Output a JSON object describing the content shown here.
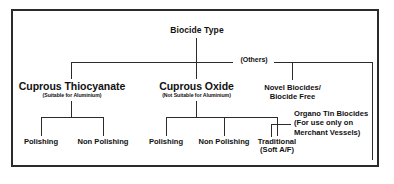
{
  "diagram": {
    "type": "tree",
    "title": "Biocide Type",
    "root": {
      "label": "Biocide Type"
    },
    "others_label": "(Others)",
    "branches": [
      {
        "id": "cuprous-thiocyanate",
        "label": "Cuprous Thiocyanate",
        "subtitle": "(Suitable for Aluminium)",
        "children": [
          {
            "id": "ct-polishing",
            "label": "Polishing"
          },
          {
            "id": "ct-non-polishing",
            "label": "Non Polishing"
          }
        ]
      },
      {
        "id": "cuprous-oxide",
        "label": "Cuprous Oxide",
        "subtitle": "(Not Suitable for Aluminium)",
        "children": [
          {
            "id": "co-polishing",
            "label": "Polishing"
          },
          {
            "id": "co-non-polishing",
            "label": "Non Polishing"
          },
          {
            "id": "co-traditional",
            "label": "Traditional",
            "sublabel": "(Soft A/F)"
          }
        ]
      },
      {
        "id": "novel-biocides",
        "label_line1": "Novel Biocides/",
        "label_line2": "Biocide Free"
      },
      {
        "id": "organo-tin-biocides",
        "label_line1": "Organo Tin Biocides",
        "label_line2": "(For use only on",
        "label_line3": "Merchant Vessels)"
      }
    ],
    "colors": {
      "line": "#2b2b2b",
      "text": "#111111",
      "background": "#ffffff",
      "border": "#2b2b2b"
    }
  }
}
